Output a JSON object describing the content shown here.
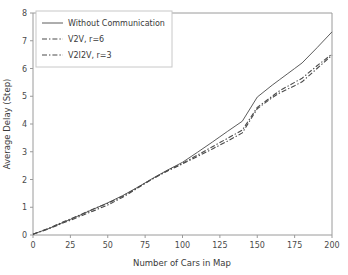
{
  "chart_data": {
    "type": "line",
    "title": "",
    "xlabel": "Number of Cars in Map",
    "ylabel": "Average Delay (Step)",
    "xlim": [
      0,
      200
    ],
    "ylim": [
      0,
      8
    ],
    "xticks": [
      0,
      25,
      50,
      75,
      100,
      125,
      150,
      175,
      200
    ],
    "yticks": [
      0,
      1,
      2,
      3,
      4,
      5,
      6,
      7,
      8
    ],
    "grid": false,
    "legend_position": "upper left",
    "x": [
      0,
      10,
      20,
      25,
      30,
      40,
      50,
      60,
      70,
      75,
      80,
      90,
      100,
      110,
      120,
      125,
      130,
      140,
      150,
      160,
      165,
      170,
      175,
      180,
      190,
      200
    ],
    "series": [
      {
        "name": "Without Communication",
        "style": "solid",
        "color": "#4a4a4a",
        "values": [
          0.03,
          0.22,
          0.45,
          0.56,
          0.68,
          0.92,
          1.16,
          1.42,
          1.72,
          1.88,
          2.04,
          2.34,
          2.62,
          2.98,
          3.35,
          3.54,
          3.73,
          4.1,
          4.97,
          5.4,
          5.6,
          5.8,
          6.0,
          6.2,
          6.75,
          7.32
        ]
      },
      {
        "name": "V2V, r=6",
        "style": "dashdot",
        "color": "#3a3a3a",
        "values": [
          0.03,
          0.23,
          0.47,
          0.58,
          0.69,
          0.93,
          1.14,
          1.4,
          1.71,
          1.87,
          2.03,
          2.32,
          2.58,
          2.88,
          3.18,
          3.33,
          3.48,
          3.78,
          4.6,
          5.0,
          5.2,
          5.35,
          5.5,
          5.65,
          6.1,
          6.52
        ]
      },
      {
        "name": "V2I2V, r=3",
        "style": "dashdot",
        "color": "#3a3a3a",
        "values": [
          0.03,
          0.21,
          0.43,
          0.53,
          0.64,
          0.86,
          1.08,
          1.36,
          1.69,
          1.86,
          2.02,
          2.31,
          2.56,
          2.83,
          3.1,
          3.24,
          3.38,
          3.68,
          4.55,
          4.95,
          5.12,
          5.25,
          5.38,
          5.52,
          6.0,
          6.48
        ]
      }
    ],
    "legend_entries": [
      {
        "label": "Without Communication",
        "style": "solid"
      },
      {
        "label": "V2V, r=6",
        "style": "dashdot"
      },
      {
        "label": "V2I2V, r=3",
        "style": "dashdot"
      }
    ]
  }
}
